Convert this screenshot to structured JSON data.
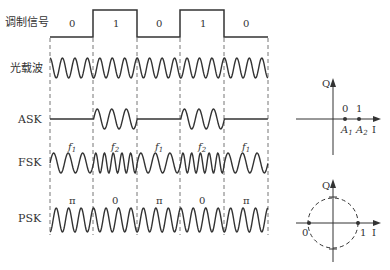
{
  "rows": {
    "signal": "调制信号",
    "carrier": "光载波",
    "ask": "ASK",
    "fsk": "FSK",
    "psk": "PSK"
  },
  "bits": [
    "0",
    "1",
    "0",
    "1",
    "0"
  ],
  "fsk_freqs": [
    "f1",
    "f2",
    "f1",
    "f2",
    "f1"
  ],
  "fsk_sub": [
    "1",
    "2",
    "1",
    "2",
    "1"
  ],
  "psk_phases": [
    "π",
    "0",
    "π",
    "0",
    "π"
  ],
  "ask_constellation": {
    "q_label": "Q",
    "i_label": "I",
    "bit0": "0",
    "bit1": "1",
    "a1": "A",
    "a1_sub": "1",
    "a2": "A",
    "a2_sub": "2"
  },
  "psk_constellation": {
    "q_label": "Q",
    "i_label": "I",
    "left": "0",
    "right": "1"
  },
  "colors": {
    "line": "#333333",
    "dash": "#777777"
  }
}
